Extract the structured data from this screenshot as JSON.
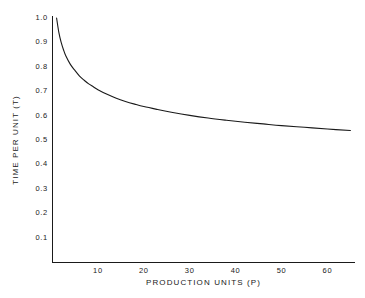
{
  "chart_data": {
    "type": "line",
    "title": "",
    "xlabel": "PRODUCTION UNITS (P)",
    "ylabel": "TIME PER UNIT (T)",
    "xlim": [
      0,
      66
    ],
    "ylim": [
      0,
      1.0
    ],
    "grid": false,
    "legend": null,
    "x_ticks": [
      10,
      20,
      30,
      40,
      50,
      60
    ],
    "x_tick_labels": [
      "10",
      "20",
      "30",
      "40",
      "50",
      "60"
    ],
    "y_ticks": [
      0.1,
      0.2,
      0.3,
      0.4,
      0.5,
      0.6,
      0.7,
      0.8,
      0.9,
      1.0
    ],
    "y_tick_labels": [
      "0.1",
      "0.2",
      "0.3",
      "0.4",
      "0.5",
      "0.6",
      "0.7",
      "0.8",
      "0.9",
      "1.0"
    ],
    "series": [
      {
        "name": "learning curve",
        "color": "#1a1a1a",
        "x": [
          1,
          1.5,
          2,
          2.5,
          3,
          4,
          5,
          6,
          7,
          8,
          9,
          10,
          12,
          14,
          16,
          18,
          20,
          23,
          26,
          30,
          34,
          38,
          42,
          46,
          50,
          55,
          60,
          65
        ],
        "y": [
          1.0,
          0.94,
          0.9,
          0.87,
          0.845,
          0.81,
          0.785,
          0.762,
          0.745,
          0.73,
          0.718,
          0.706,
          0.687,
          0.671,
          0.658,
          0.647,
          0.637,
          0.625,
          0.614,
          0.601,
          0.59,
          0.581,
          0.573,
          0.566,
          0.559,
          0.552,
          0.545,
          0.539
        ]
      }
    ]
  },
  "axes": {
    "x_axis_name": "x-axis",
    "y_axis_name": "y-axis"
  }
}
